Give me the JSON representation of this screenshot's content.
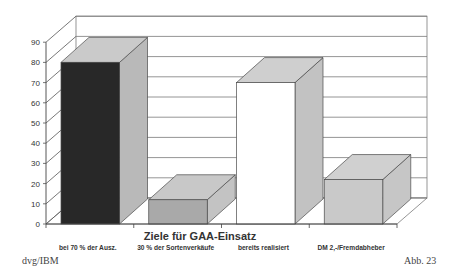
{
  "figure": {
    "source": "dvg/IBM",
    "figure_number": "Abb. 23"
  },
  "chart_data": {
    "type": "bar",
    "subtype": "3d-column",
    "title": "",
    "xlabel": "Ziele für GAA-Einsatz",
    "ylabel": "",
    "categories": [
      "bei 70 % der Ausz.",
      "30 % der Sortenverkäufe",
      "bereits realisiert",
      "DM 2,-/Fremdabheber"
    ],
    "values": [
      80,
      12,
      70,
      22
    ],
    "ylim": [
      0,
      90
    ],
    "yticks": [
      0,
      10,
      20,
      30,
      40,
      50,
      60,
      70,
      80,
      90
    ],
    "grid": true,
    "legend": null,
    "bar_colors": [
      {
        "front": "#282828",
        "top": "#cacaca",
        "side": "#b9b9b9"
      },
      {
        "front": "#a9a9a9",
        "top": "#c8c8c8",
        "side": "#c3c3c3"
      },
      {
        "front": "#ffffff",
        "top": "#cfcfcf",
        "side": "#c2c2c2"
      },
      {
        "front": "#c9c9c9",
        "top": "#d0d0d0",
        "side": "#c6c6c6"
      }
    ]
  }
}
